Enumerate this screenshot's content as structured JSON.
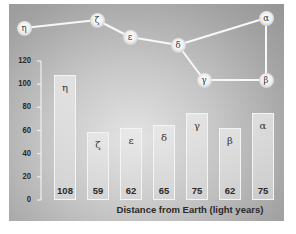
{
  "chart_data": {
    "type": "bar",
    "title": "",
    "xlabel": "Distance from Earth (light years)",
    "ylabel": "",
    "ylim": [
      0,
      120
    ],
    "yticks": [
      0,
      20,
      40,
      60,
      80,
      100,
      120
    ],
    "grid": false,
    "legend": null,
    "categories": [
      "η",
      "ζ",
      "ε",
      "δ",
      "γ",
      "β",
      "α"
    ],
    "values": [
      108,
      59,
      62,
      65,
      75,
      62,
      75
    ],
    "annotations": {
      "constellation_diagram": {
        "description": "Star pattern connecting labeled stars with lines above the bar chart",
        "stars": [
          {
            "label": "η",
            "x": 24,
            "y": 28
          },
          {
            "label": "ζ",
            "x": 97,
            "y": 20
          },
          {
            "label": "ε",
            "x": 130,
            "y": 37
          },
          {
            "label": "δ",
            "x": 178,
            "y": 45
          },
          {
            "label": "γ",
            "x": 204,
            "y": 80
          },
          {
            "label": "β",
            "x": 266,
            "y": 80
          },
          {
            "label": "α",
            "x": 266,
            "y": 18
          }
        ],
        "connections": [
          [
            "η",
            "ζ"
          ],
          [
            "ζ",
            "ε"
          ],
          [
            "ε",
            "δ"
          ],
          [
            "δ",
            "γ"
          ],
          [
            "γ",
            "β"
          ],
          [
            "β",
            "α"
          ],
          [
            "α",
            "δ"
          ]
        ]
      }
    }
  },
  "axis": {
    "ticks": [
      {
        "label": "120",
        "value": 120
      },
      {
        "label": "100",
        "value": 100
      },
      {
        "label": "80",
        "value": 80
      },
      {
        "label": "60",
        "value": 60
      },
      {
        "label": "40",
        "value": 40
      },
      {
        "label": "20",
        "value": 20
      },
      {
        "label": "0",
        "value": 0
      }
    ]
  },
  "bars": [
    {
      "symbol": "η",
      "value_label": "108",
      "value": 108
    },
    {
      "symbol": "ζ",
      "value_label": "59",
      "value": 59
    },
    {
      "symbol": "ε",
      "value_label": "62",
      "value": 62
    },
    {
      "symbol": "δ",
      "value_label": "65",
      "value": 65
    },
    {
      "symbol": "γ",
      "value_label": "75",
      "value": 75
    },
    {
      "symbol": "β",
      "value_label": "62",
      "value": 62
    },
    {
      "symbol": "α",
      "value_label": "75",
      "value": 75
    }
  ],
  "xlabel": "Distance from Earth (light years)",
  "colors": {
    "panel_center": "#e4e4e4",
    "panel_edge": "#959595",
    "bar_border": "#f4f4f4",
    "line": "#f8f8f8",
    "text": "#2a2a2a"
  }
}
